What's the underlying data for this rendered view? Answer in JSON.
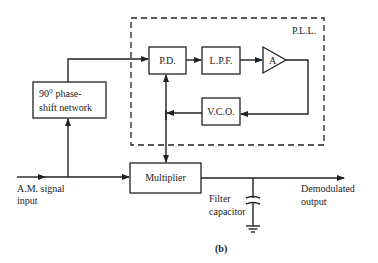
{
  "diagram": {
    "caption": "(b)",
    "pll_label": "P.L.L.",
    "blocks": {
      "phase_detector": "P.D.",
      "low_pass_filter": "L.P.F.",
      "amplifier": "A",
      "vco": "V.C.O.",
      "phase_shift_line1": "90° phase-",
      "phase_shift_line2": "shift network",
      "multiplier": "Multiplier"
    },
    "labels": {
      "input_line1": "A.M. signal",
      "input_line2": "input",
      "filter_line1": "Filter",
      "filter_line2": "capacitor",
      "output_line1": "Demodulated",
      "output_line2": "output"
    },
    "colors": {
      "stroke": "#222222",
      "background": "#ffffff"
    }
  }
}
